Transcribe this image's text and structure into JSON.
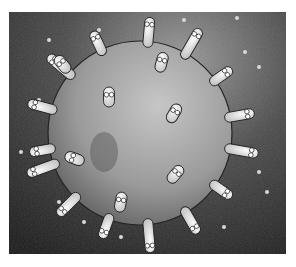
{
  "image": {
    "description": "Grayscale illustration of a grey planet-like sphere covered with white blob-shaped creatures with big eyes, standing around its rim and on its surface, against a dark textured background with small floating specks",
    "palette": {
      "background_dark": "#1e1e1e",
      "background_light": "#8a8a8a",
      "sphere_light": "#b9b9b9",
      "sphere_dark": "#5e5e5e",
      "creature": "#eeeeee",
      "outline": "#222222",
      "frame": "#ffffff"
    },
    "creature_count_rim": 15,
    "creature_count_surface": 7
  }
}
